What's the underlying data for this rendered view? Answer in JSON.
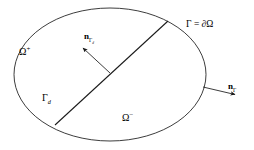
{
  "figure": {
    "kind": "math-domain-diagram",
    "background_color": "#ffffff",
    "stroke_color": "#1a1a1a",
    "width": 254,
    "height": 150
  },
  "labels": {
    "omega_plus": "Ω",
    "omega_plus_sup": "+",
    "omega_minus": "Ω",
    "omega_minus_sup": "−",
    "gamma_d": "Γ",
    "gamma_d_sub": "d",
    "normal_gamma_d_n": "n",
    "normal_gamma_d_sub_gamma": "Γ",
    "normal_gamma_d_sub_d": "d",
    "boundary_gamma": "Γ",
    "boundary_equals": " = ",
    "boundary_partial_omega": "∂Ω",
    "normal_gamma_n": "n",
    "normal_gamma_sub": "Γ"
  },
  "geometry": {
    "outer_boundary": {
      "name": "Gamma",
      "shape": "ellipse",
      "cx": 110,
      "cy": 74.5,
      "rx": 96,
      "ry": 66.5
    },
    "interface": {
      "name": "Gamma_d",
      "shape": "line",
      "x1": 55,
      "y1": 125,
      "x2": 168,
      "y2": 21
    },
    "interface_normal_arrow": {
      "name": "n_Gamma_d",
      "x1": 110,
      "y1": 73,
      "x2": 81.5,
      "y2": 46.5
    },
    "boundary_normal_arrow": {
      "name": "n_Gamma",
      "x1": 203,
      "y1": 87,
      "x2": 237,
      "y2": 95
    }
  }
}
